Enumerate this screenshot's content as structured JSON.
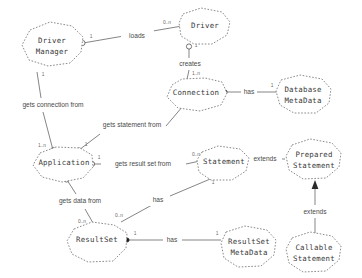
{
  "diagram": {
    "type": "entity-relationship",
    "style": {
      "entity_outline": "#7d7d7d",
      "entity_fill": "#ffffff",
      "line_color": "#6f6f6f",
      "text_color": "#3a3a3a",
      "background": "#ffffff"
    },
    "entities": [
      {
        "id": "driver-manager",
        "label_line1": "Driver",
        "label_line2": "Manager",
        "cx": 52,
        "cy": 45
      },
      {
        "id": "driver",
        "label_line1": "Driver",
        "label_line2": "",
        "cx": 205,
        "cy": 25
      },
      {
        "id": "connection",
        "label_line1": "Connection",
        "label_line2": "",
        "cx": 196,
        "cy": 95
      },
      {
        "id": "database-metadata",
        "label_line1": "Database",
        "label_line2": "MetaData",
        "cx": 300,
        "cy": 95
      },
      {
        "id": "application",
        "label_line1": "Application",
        "label_line2": "",
        "cx": 66,
        "cy": 163
      },
      {
        "id": "statement",
        "label_line1": "Statement",
        "label_line2": "",
        "cx": 225,
        "cy": 164
      },
      {
        "id": "prepared-statement",
        "label_line1": "Prepared",
        "label_line2": "Statement",
        "cx": 315,
        "cy": 160
      },
      {
        "id": "callable-statement",
        "label_line1": "Callable",
        "label_line2": "Statement",
        "cx": 315,
        "cy": 252
      },
      {
        "id": "result-set",
        "label_line1": "ResultSet",
        "label_line2": "",
        "cx": 98,
        "cy": 243
      },
      {
        "id": "result-set-metadata",
        "label_line1": "ResultSet",
        "label_line2": "MetaData",
        "cx": 247,
        "cy": 247
      }
    ],
    "relationships": [
      {
        "id": "loads",
        "label": "loads",
        "from": "driver-manager",
        "to": "driver",
        "from_cardinality": "1",
        "to_cardinality": "0..n",
        "label_x": 137,
        "label_y": 36
      },
      {
        "id": "creates",
        "label": "creates",
        "from": "driver",
        "to": "connection",
        "from_cardinality": "1",
        "to_cardinality": "1..n",
        "label_x": 190,
        "label_y": 64
      },
      {
        "id": "connection-has-dbmeta",
        "label": "has",
        "from": "connection",
        "to": "database-metadata",
        "from_cardinality": "",
        "to_cardinality": "1",
        "label_x": 248,
        "label_y": 91
      },
      {
        "id": "gets-connection-from",
        "label": "gets connection from",
        "from": "application",
        "to": "driver-manager",
        "from_cardinality": "1..n",
        "to_cardinality": "1",
        "label_x": 53,
        "label_y": 105
      },
      {
        "id": "gets-statement-from",
        "label": "gets statement from",
        "from": "application",
        "to": "connection",
        "from_cardinality": "1",
        "to_cardinality": "",
        "label_x": 132,
        "label_y": 125
      },
      {
        "id": "gets-result-set-from",
        "label": "gets result set from",
        "from": "application",
        "to": "statement",
        "from_cardinality": "1",
        "to_cardinality": "1..n",
        "label_x": 143,
        "label_y": 163
      },
      {
        "id": "gets-data-from",
        "label": "gets data from",
        "from": "application",
        "to": "result-set",
        "from_cardinality": "1",
        "to_cardinality": "0..n",
        "label_x": 80,
        "label_y": 201
      },
      {
        "id": "statement-has-resultset",
        "label": "has",
        "from": "statement",
        "to": "result-set",
        "from_cardinality": "1",
        "to_cardinality": "0..n",
        "label_x": 158,
        "label_y": 201
      },
      {
        "id": "resultset-has-meta",
        "label": "has",
        "from": "result-set",
        "to": "result-set-metadata",
        "from_cardinality": "1",
        "to_cardinality": "1",
        "label_x": 172,
        "label_y": 242
      },
      {
        "id": "prepared-extends-statement",
        "label": "extends",
        "from": "prepared-statement",
        "to": "statement",
        "from_cardinality": "",
        "to_cardinality": "",
        "label_x": 265,
        "label_y": 160
      },
      {
        "id": "callable-extends-prepared",
        "label": "extends",
        "from": "callable-statement",
        "to": "prepared-statement",
        "from_cardinality": "",
        "to_cardinality": "",
        "label_x": 315,
        "label_y": 212
      }
    ]
  }
}
